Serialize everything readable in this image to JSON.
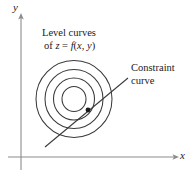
{
  "figure": {
    "type": "diagram",
    "background_color": "#ffffff",
    "stroke_color": "#3a3a3a",
    "text_color": "#1a1a1a"
  },
  "axes": {
    "x_label": "x",
    "y_label": "y",
    "x_axis": {
      "x1": 8,
      "y1": 157,
      "x2": 178,
      "y2": 157,
      "arrow": "right"
    },
    "y_axis": {
      "x1": 21,
      "y1": 170,
      "x2": 21,
      "y2": 14,
      "arrow": "up"
    }
  },
  "annotations": {
    "level_curves": {
      "line1": "Level curves",
      "line2_prefix": "of ",
      "line2_z": "z",
      "line2_eq": " = ",
      "line2_f": "f",
      "line2_args_open": "(",
      "line2_x": "x",
      "line2_comma": ", ",
      "line2_y": "y",
      "line2_args_close": ")"
    },
    "constraint": {
      "line1": "Constraint",
      "line2": "curve"
    }
  },
  "level_curves": {
    "center": {
      "cx": 74,
      "cy": 99
    },
    "rings": [
      {
        "rx": 12,
        "ry": 12.5
      },
      {
        "rx": 20.5,
        "ry": 21
      },
      {
        "rx": 29,
        "ry": 29.5
      },
      {
        "rx": 38,
        "ry": 38.5
      }
    ]
  },
  "constraint_curve": {
    "start": {
      "x": 45,
      "y": 147
    },
    "end": {
      "x": 128,
      "y": 78
    },
    "tangent_point": {
      "x": 88,
      "y": 110
    },
    "tangent_dot_radius": 2.4
  },
  "colors": {
    "curve": "#3a3a3a",
    "axis": "#8c8c8c",
    "dot": "#1a1a1a",
    "text": "#1a1a1a"
  }
}
